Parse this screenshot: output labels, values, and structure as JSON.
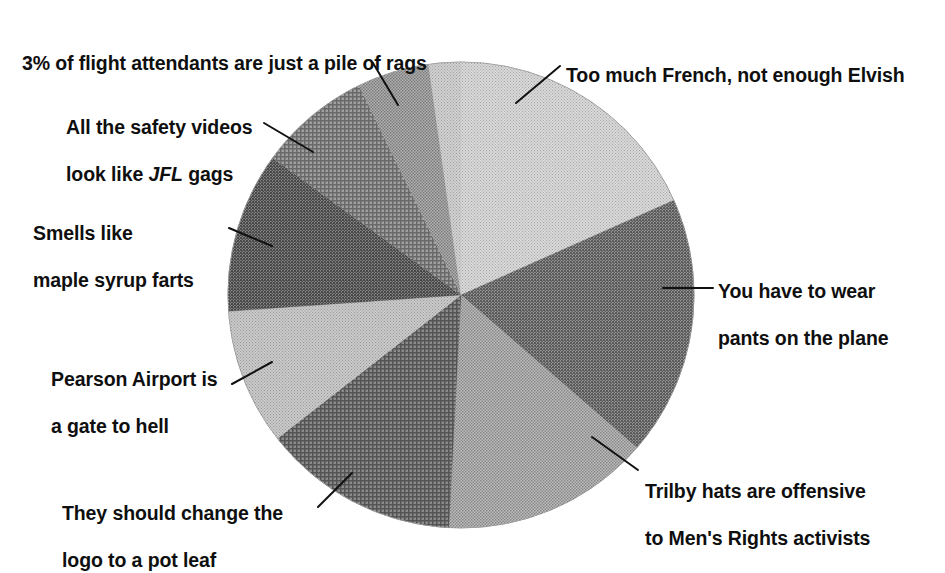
{
  "chart_data": {
    "type": "pie",
    "title": "",
    "subtitle": "",
    "xlabel": "",
    "ylabel": "",
    "legend_position": "callout-labels",
    "grid": false,
    "center": {
      "x": 461,
      "y": 295
    },
    "radius": 233,
    "note": "Unlabelled hand-styled pie; slice sizes estimated from pixel boundary angles. Angles measured clockwise from 12 o'clock.",
    "categories": [
      "Too much French, not enough Elvish",
      "You have to wear pants on the plane",
      "Trilby hats are offensive to Men's Rights activists",
      "They should change the logo to a pot leaf",
      "Pearson Airport is a gate to hell",
      "Smells like maple syrup farts",
      "All the safety videos look like JFL gags",
      "3% of flight attendants are just a pile of rags"
    ],
    "slices": [
      {
        "id": "elvish",
        "label": "Too much French, not enough Elvish",
        "label_html": "Too much French, not enough Elvish",
        "start_angle": 0,
        "end_angle": 66,
        "value": 18.3,
        "fill": "#c9c9c9",
        "pattern": "fine-dot",
        "leader": {
          "x1": 560,
          "y1": 66,
          "x2": 516,
          "y2": 103
        },
        "label_side": "right"
      },
      {
        "id": "pants",
        "label": "You have to wear pants on the plane",
        "label_html": "You have to wear\npants on the plane",
        "start_angle": 66,
        "end_angle": 131,
        "value": 18.1,
        "fill": "#6d6d6d",
        "pattern": "coarse-dot",
        "leader": {
          "x1": 713,
          "y1": 288,
          "x2": 663,
          "y2": 288
        },
        "label_side": "right"
      },
      {
        "id": "trilby",
        "label": "Trilby hats are offensive to Men's Rights activists",
        "label_html": "Trilby hats are offensive\nto Men's Rights activists",
        "start_angle": 131,
        "end_angle": 183,
        "value": 14.4,
        "fill": "#a0a0a0",
        "pattern": "medium-dot",
        "leader": {
          "x1": 638,
          "y1": 470,
          "x2": 592,
          "y2": 437
        },
        "label_side": "right"
      },
      {
        "id": "potleaf",
        "label": "They should change the logo to a pot leaf",
        "label_html": "They should change the\nlogo to a pot leaf",
        "start_angle": 183,
        "end_angle": 232,
        "value": 13.6,
        "fill": "#595959",
        "pattern": "cross-hatch",
        "leader": {
          "x1": 318,
          "y1": 507,
          "x2": 352,
          "y2": 473
        },
        "label_side": "left"
      },
      {
        "id": "pearson",
        "label": "Pearson Airport is a gate to hell",
        "label_html": "Pearson Airport is\na gate to hell",
        "start_angle": 232,
        "end_angle": 266,
        "value": 9.4,
        "fill": "#b4b4b4",
        "pattern": "fine-dot",
        "leader": {
          "x1": 232,
          "y1": 384,
          "x2": 272,
          "y2": 362
        },
        "label_side": "left"
      },
      {
        "id": "maple",
        "label": "Smells like maple syrup farts",
        "label_html": "Smells like\nmaple syrup farts",
        "start_angle": 266,
        "end_angle": 306,
        "value": 11.1,
        "fill": "#555555",
        "pattern": "coarse-dot",
        "leader": {
          "x1": 229,
          "y1": 228,
          "x2": 272,
          "y2": 246
        },
        "label_side": "left"
      },
      {
        "id": "jfl",
        "label": "All the safety videos look like JFL gags",
        "label_html": "All the safety videos\nlook like JFL gags",
        "label_italic_word": "JFL",
        "start_angle": 306,
        "end_angle": 334,
        "value": 7.8,
        "fill": "#777777",
        "pattern": "cross-hatch",
        "leader": {
          "x1": 264,
          "y1": 123,
          "x2": 313,
          "y2": 152
        },
        "label_side": "left"
      },
      {
        "id": "rags",
        "label": "3% of flight attendants are just a pile of rags",
        "label_html": "3% of flight attendants are just a pile of rags",
        "start_angle": 334,
        "end_angle": 352,
        "value": 5.0,
        "fill": "#8f8f8f",
        "pattern": "medium-dot",
        "leader": {
          "x1": 373,
          "y1": 63,
          "x2": 398,
          "y2": 105
        },
        "label_side": "left"
      },
      {
        "id": "rags-tail",
        "label": "3% of flight attendants are just a pile of rags",
        "label_html": "",
        "start_angle": 352,
        "end_angle": 360,
        "value": 2.2,
        "fill": "#bdbdbd",
        "pattern": "fine-dot",
        "leader": null,
        "label_side": "none"
      }
    ]
  },
  "labels": {
    "rags": "3% of flight attendants are just a pile of rags",
    "elvish": "Too much French, not enough Elvish",
    "jfl_line1": "All the safety videos",
    "jfl_line2_pre": "look like ",
    "jfl_line2_em": "JFL",
    "jfl_line2_post": " gags",
    "maple_line1": "Smells like",
    "maple_line2": "maple syrup farts",
    "pants_line1": "You have to wear",
    "pants_line2": "pants on the plane",
    "pearson_line1": "Pearson Airport is",
    "pearson_line2": "a gate to hell",
    "trilby_line1": "Trilby hats are offensive",
    "trilby_line2": "to Men's Rights activists",
    "potleaf_line1": "They should change the",
    "potleaf_line2": "logo to a pot leaf"
  }
}
